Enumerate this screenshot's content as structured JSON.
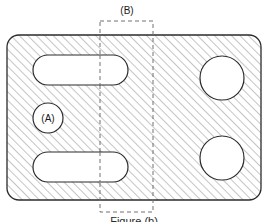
{
  "figure": {
    "type": "engineering-section-drawing",
    "background_color": "#ffffff",
    "line_color": "#1a1a1a",
    "hatch_color": "#8c8c8c",
    "dashed_color": "#707070",
    "fill_color": "#ffffff",
    "plate": {
      "name": "hatched-plate-body",
      "x": 7,
      "y": 35,
      "width": 254,
      "height": 165,
      "corner_radius": 12,
      "hatch_angle_deg": 45,
      "hatch_spacing_px": 6
    },
    "labels": {
      "callout_a": "(A)",
      "callout_b": "(B)"
    },
    "features": [
      {
        "name": "top-slot",
        "shape": "stadium",
        "x": 33,
        "y": 55,
        "width": 95,
        "height": 30,
        "radius": 15
      },
      {
        "name": "bottom-slot",
        "shape": "stadium",
        "x": 33,
        "y": 152,
        "width": 95,
        "height": 30,
        "radius": 15
      },
      {
        "name": "callout-a-circle",
        "shape": "circle",
        "cx": 48,
        "cy": 118,
        "r": 15
      },
      {
        "name": "top-right-hole",
        "shape": "circle",
        "cx": 222,
        "cy": 78,
        "r": 22
      },
      {
        "name": "bottom-right-hole",
        "shape": "circle",
        "cx": 222,
        "cy": 158,
        "r": 22
      }
    ],
    "section_box": {
      "name": "section-b-boundary",
      "x": 100,
      "y": 21,
      "width": 53,
      "height": 191,
      "style": "dashed"
    },
    "caption": {
      "text": "Figure  (b)",
      "visible": "partially-cropped"
    }
  }
}
